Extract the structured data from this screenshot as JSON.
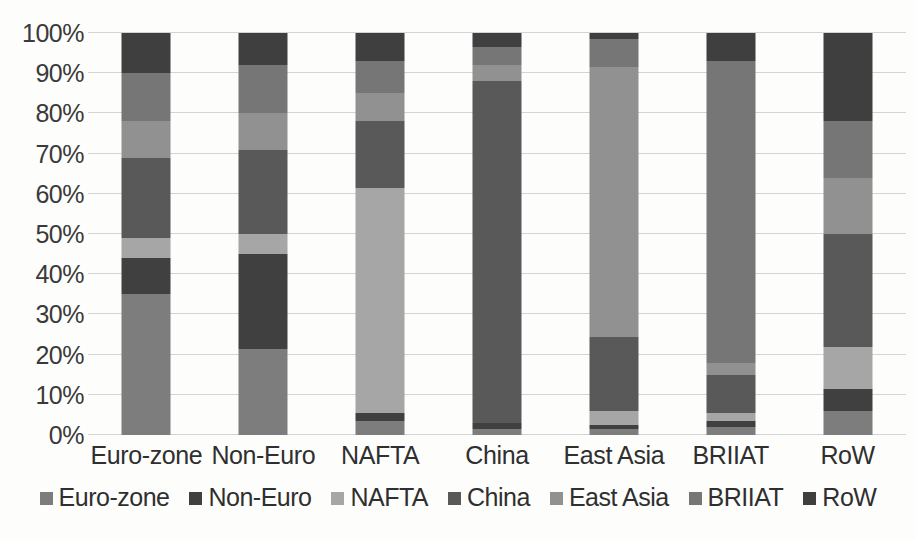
{
  "chart_data": {
    "type": "bar",
    "subtype": "stacked-100-percent",
    "title": "",
    "xlabel": "",
    "ylabel": "",
    "ylim": [
      0,
      100
    ],
    "ytick_labels": [
      "0%",
      "10%",
      "20%",
      "30%",
      "40%",
      "50%",
      "60%",
      "70%",
      "80%",
      "90%",
      "100%"
    ],
    "ytick_values": [
      0,
      10,
      20,
      30,
      40,
      50,
      60,
      70,
      80,
      90,
      100
    ],
    "grid": true,
    "legend_position": "bottom",
    "categories": [
      "Euro-zone",
      "Non-Euro",
      "NAFTA",
      "China",
      "East Asia",
      "BRIIAT",
      "RoW"
    ],
    "series": [
      {
        "name": "Euro-zone",
        "color": "#7d7d7d",
        "values": [
          35.0,
          21.5,
          3.5,
          1.5,
          1.5,
          2.0,
          6.0
        ]
      },
      {
        "name": "Non-Euro",
        "color": "#404040",
        "values": [
          9.0,
          23.5,
          2.0,
          1.5,
          1.0,
          1.5,
          5.5
        ]
      },
      {
        "name": "NAFTA",
        "color": "#a6a6a6",
        "values": [
          5.0,
          5.0,
          56.0,
          0.0,
          3.5,
          2.0,
          10.5
        ]
      },
      {
        "name": "China",
        "color": "#595959",
        "values": [
          20.0,
          21.0,
          16.5,
          85.0,
          18.5,
          9.5,
          28.0
        ]
      },
      {
        "name": "East Asia",
        "color": "#919191",
        "values": [
          9.0,
          9.0,
          7.0,
          4.0,
          67.0,
          3.0,
          14.0
        ]
      },
      {
        "name": "BRIIAT",
        "color": "#767676",
        "values": [
          12.0,
          12.0,
          8.0,
          4.5,
          7.0,
          75.0,
          14.0
        ]
      },
      {
        "name": "RoW",
        "color": "#3f3f3f",
        "values": [
          10.0,
          8.0,
          7.0,
          3.5,
          1.5,
          7.0,
          22.0
        ]
      }
    ]
  },
  "legend": {
    "items": [
      {
        "label": "Euro-zone",
        "color": "#7d7d7d"
      },
      {
        "label": "Non-Euro",
        "color": "#404040"
      },
      {
        "label": "NAFTA",
        "color": "#a6a6a6"
      },
      {
        "label": "China",
        "color": "#595959"
      },
      {
        "label": "East Asia",
        "color": "#919191"
      },
      {
        "label": "BRIIAT",
        "color": "#767676"
      },
      {
        "label": "RoW",
        "color": "#3f3f3f"
      }
    ]
  }
}
